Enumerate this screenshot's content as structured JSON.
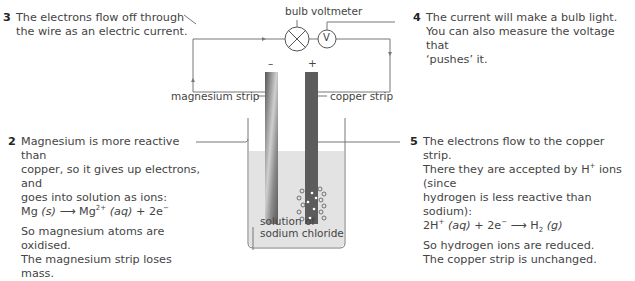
{
  "labels": {
    "bulb": "bulb",
    "voltmeter": "voltmeter",
    "voltmeter_symbol": "V",
    "negative_terminal": "–",
    "positive_terminal": "+",
    "magnesium_strip": "magnesium strip",
    "copper_strip": "copper strip",
    "solution_line1": "solution of",
    "solution_line2": "sodium chloride"
  },
  "notes": [
    {
      "number": "3",
      "lines": [
        "The electrons flow off through",
        "the wire as an electric current."
      ]
    },
    {
      "number": "4",
      "lines": [
        "The current will make a bulb light.",
        "You can also measure the voltage that",
        "‘pushes’ it."
      ]
    },
    {
      "number": "2",
      "lines": [
        "Magnesium is more reactive than",
        "copper, so it gives up electrons, and",
        "goes into solution as ions:"
      ],
      "equation": {
        "lhs": "Mg",
        "lhs_state": "(s)",
        "arrow": "⟶",
        "product": "Mg",
        "product_charge": "2+",
        "product_state": "(aq)",
        "plus": "+",
        "electrons": "2e",
        "electron_charge": "−"
      },
      "conclusion": [
        "So magnesium atoms are oxidised.",
        "The magnesium strip loses mass."
      ]
    },
    {
      "number": "5",
      "lines": [
        "The electrons flow to the copper strip.",
        "There they are accepted by H",
        " ions (since",
        "hydrogen is less reactive than sodium):"
      ],
      "equation": {
        "reactant": "2H",
        "reactant_charge": "+",
        "reactant_state": "(aq)",
        "plus": "+",
        "electrons": "2e",
        "electron_charge": "−",
        "arrow": "⟶",
        "product": "H",
        "product_sub": "2",
        "product_state": "(g)"
      },
      "conclusion": [
        "So hydrogen ions are reduced.",
        "The copper strip is unchanged."
      ]
    }
  ],
  "colors": {
    "wire": "#666666",
    "solution": "#e3e3e3",
    "copper": "#5c5c5c",
    "text": "#444444"
  }
}
